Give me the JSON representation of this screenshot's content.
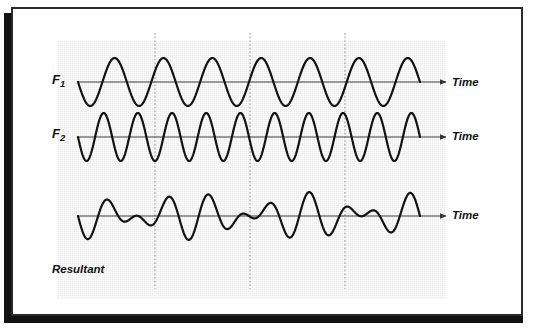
{
  "figure": {
    "panel_background_color": "#ebebeb",
    "frame_border_color": "#2a2a2a",
    "shadow_color": "#111111",
    "curve_color": "#121212",
    "axis_color": "#444444",
    "gridline_color": "#888888"
  },
  "labels": {
    "f1_base": "F",
    "f1_sub": "1",
    "f2_base": "F",
    "f2_sub": "2",
    "resultant": "Resultant",
    "time_1": "Time",
    "time_2": "Time",
    "time_3": "Time"
  },
  "chart_data": {
    "type": "line",
    "xlabel": "Time",
    "ylabel": "",
    "grid": true,
    "gridlines_vertical_x": [
      155,
      250,
      345
    ],
    "legend": "none",
    "x": [
      0,
      1
    ],
    "series": [
      {
        "name": "F1",
        "label": "F₁",
        "waveform": "sine",
        "cycles": 7,
        "amplitude": 24,
        "baseline_y": 82,
        "phase_deg": 180,
        "x_start": 78,
        "x_end": 420
      },
      {
        "name": "F2",
        "label": "F₂",
        "waveform": "sine",
        "cycles": 10,
        "amplitude": 24,
        "baseline_y": 137,
        "phase_deg": 180,
        "x_start": 78,
        "x_end": 420
      },
      {
        "name": "Resultant",
        "label": "Resultant",
        "waveform": "sum-of-F1-and-F2",
        "cycles": 17,
        "amplitude": 24,
        "baseline_y": 216,
        "phase_deg": 180,
        "x_start": 78,
        "x_end": 420,
        "beats": 3,
        "note": "Superposition of F1 (7 cycles) and F2 (10 cycles) producing 3 beat envelopes"
      }
    ],
    "axis_arrows": [
      {
        "y": 82,
        "x_start": 78,
        "x_end": 447,
        "label": "Time"
      },
      {
        "y": 137,
        "x_start": 78,
        "x_end": 447,
        "label": "Time"
      },
      {
        "y": 216,
        "x_start": 78,
        "x_end": 447,
        "label": "Time"
      }
    ]
  }
}
